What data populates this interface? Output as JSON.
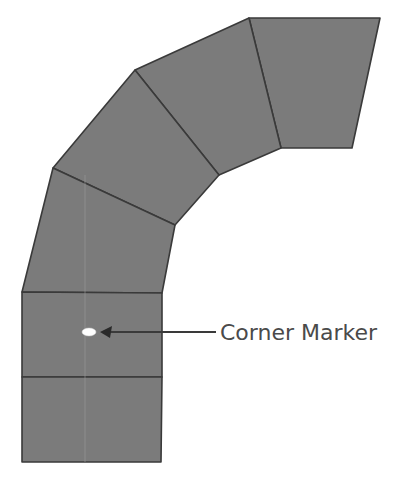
{
  "diagram": {
    "type": "curved-track-segments",
    "fill_color": "#7b7b7b",
    "stroke_color": "#3a3a3a",
    "segments": [
      {
        "id": "seg-1",
        "points": "249,18 380,18 352,148 281,148"
      },
      {
        "id": "seg-2",
        "points": "135,70 249,18 281,148 219,175"
      },
      {
        "id": "seg-3",
        "points": "53,168 135,70 219,175 175,225"
      },
      {
        "id": "seg-4",
        "points": "22,292 53,168 175,225 162,293"
      },
      {
        "id": "seg-5",
        "points": "22,292 162,293 162,377 22,377"
      },
      {
        "id": "seg-6",
        "points": "22,377 162,377 161,462 22,462"
      }
    ],
    "marker": {
      "cx": 89,
      "cy": 332,
      "rx": 7,
      "ry": 4,
      "color": "#ffffff"
    },
    "annotation": {
      "label": "Corner Marker",
      "color": "#4a4a4a"
    }
  }
}
